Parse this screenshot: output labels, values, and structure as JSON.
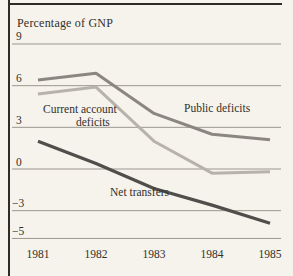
{
  "figure": {
    "colors": {
      "background": "#f6f3ed",
      "ink": "#322f2a",
      "grid": "#928d83",
      "frame": "#2f2c27"
    }
  },
  "chart_data": {
    "type": "line",
    "title": "Percentage of GNP",
    "xlabel": "",
    "ylabel": "Percentage of GNP",
    "x_categories": [
      "1981",
      "1982",
      "1983",
      "1984",
      "1985"
    ],
    "ylim": [
      -5,
      9
    ],
    "grid": "horizontal",
    "legend_position": "inline-annotations",
    "y_ticks": [
      {
        "value": 9,
        "label": "9"
      },
      {
        "value": 6,
        "label": "6"
      },
      {
        "value": 3,
        "label": "3"
      },
      {
        "value": 0,
        "label": "0"
      },
      {
        "value": -3,
        "label": "−3"
      },
      {
        "value": -5,
        "label": "−5"
      }
    ],
    "series": [
      {
        "name": "Current account deficits",
        "color": "#b7b3ac",
        "stroke_width": 3,
        "values": [
          5.4,
          5.9,
          2.0,
          -0.3,
          -0.2
        ]
      },
      {
        "name": "Public deficits",
        "color": "#8b8680",
        "stroke_width": 3,
        "values": [
          6.4,
          6.9,
          4.0,
          2.5,
          2.1
        ]
      },
      {
        "name": "Net transfers",
        "color": "#504e4a",
        "stroke_width": 3.2,
        "values": [
          2.0,
          0.4,
          -1.4,
          -2.6,
          -3.9
        ]
      }
    ],
    "annotations": [
      {
        "text": "Current account",
        "x": 43,
        "y": 103
      },
      {
        "text": "deficits",
        "x": 76,
        "y": 116
      },
      {
        "text": "Public deficits",
        "x": 184,
        "y": 102
      },
      {
        "text": "Net transfers",
        "x": 110,
        "y": 186
      }
    ],
    "plot_px": {
      "x_start": 38,
      "x_step": 58,
      "y_zero": 169,
      "px_per_unit": 13.89,
      "grid_x1": 12,
      "grid_x2": 281
    }
  }
}
